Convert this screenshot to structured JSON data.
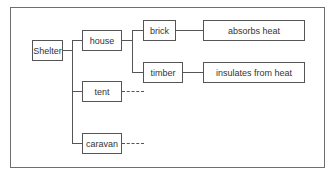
{
  "diagram": {
    "type": "tree",
    "root": {
      "label": "Shelter"
    },
    "level1": [
      {
        "label": "house"
      },
      {
        "label": "tent"
      },
      {
        "label": "caravan"
      }
    ],
    "house_children": [
      {
        "label": "brick",
        "property": "absorbs heat"
      },
      {
        "label": "timber",
        "property": "insulates from heat"
      }
    ]
  }
}
